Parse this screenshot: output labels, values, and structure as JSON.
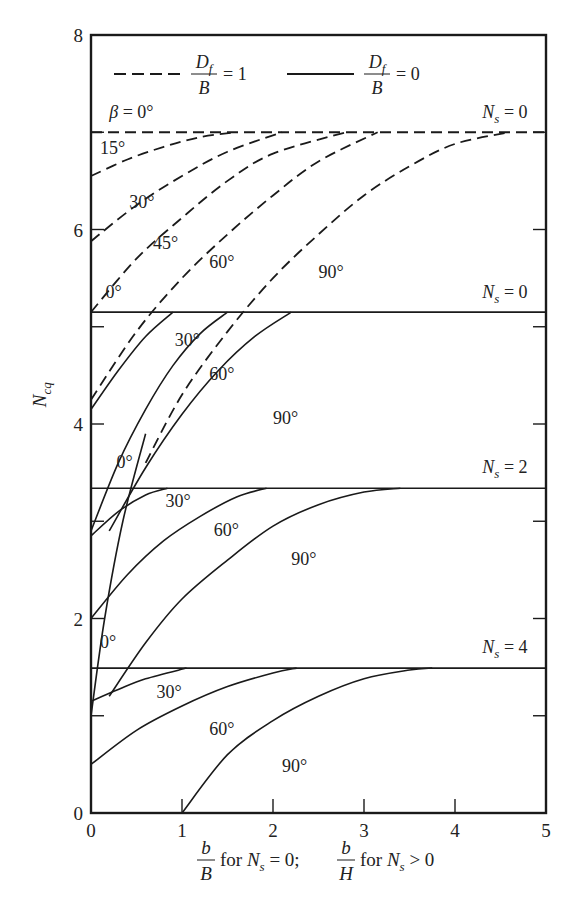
{
  "chart_data": {
    "type": "line",
    "title": "",
    "xlabel": "b/B for N_s = 0; b/H for N_s > 0",
    "ylabel": "N_cq",
    "xlim": [
      0,
      5
    ],
    "ylim": [
      0,
      8
    ],
    "x_ticks": [
      "0",
      "1",
      "2",
      "3",
      "4",
      "5"
    ],
    "y_ticks": [
      "0",
      "2",
      "4",
      "6",
      "8"
    ],
    "grid": false,
    "legend": {
      "position": "top-inside",
      "entries": [
        {
          "style": "dashed",
          "label": "D_f/B = 1",
          "numerator": "D",
          "subscript": "f",
          "denominator": "B",
          "value": "= 1"
        },
        {
          "style": "solid",
          "label": "D_f/B = 0",
          "numerator": "D",
          "subscript": "f",
          "denominator": "B",
          "value": "= 0"
        }
      ]
    },
    "annotations": [
      {
        "text": "β = 0°",
        "x": 0.2,
        "y": 7.15
      },
      {
        "text": "N_s = 0",
        "x": 4.3,
        "y": 7.15
      },
      {
        "text": "N_s = 0",
        "x": 4.3,
        "y": 5.3
      },
      {
        "text": "N_s = 2",
        "x": 4.3,
        "y": 3.5
      },
      {
        "text": "N_s = 4",
        "x": 4.3,
        "y": 1.65
      }
    ],
    "series": [
      {
        "name": "Df/B=1, Ns=0, β=0°",
        "style": "dashed",
        "label": "β = 0°",
        "x": [
          0,
          5
        ],
        "y": [
          7.0,
          7.0
        ]
      },
      {
        "name": "Df/B=1, Ns=0, β=15°",
        "style": "dashed",
        "label": "15°",
        "x": [
          0,
          0.4,
          0.8,
          1.2,
          1.6
        ],
        "y": [
          6.55,
          6.72,
          6.85,
          6.95,
          7.0
        ]
      },
      {
        "name": "Df/B=1, Ns=0, β=30°",
        "style": "dashed",
        "label": "30°",
        "x": [
          0,
          0.5,
          1.0,
          1.5,
          2.1
        ],
        "y": [
          5.88,
          6.25,
          6.55,
          6.8,
          7.0
        ]
      },
      {
        "name": "Df/B=1, Ns=0, β=45°",
        "style": "dashed",
        "label": "45°",
        "x": [
          0,
          0.5,
          1.0,
          1.5,
          2.0,
          2.8
        ],
        "y": [
          5.15,
          5.7,
          6.12,
          6.5,
          6.78,
          7.0
        ]
      },
      {
        "name": "Df/B=1, Ns=0, β=60°",
        "style": "dashed",
        "label": "60°",
        "x": [
          0.0,
          0.5,
          1.0,
          1.5,
          2.0,
          2.5,
          3.15
        ],
        "y": [
          4.25,
          4.95,
          5.5,
          5.95,
          6.35,
          6.7,
          7.0
        ]
      },
      {
        "name": "Df/B=1, Ns=0, β=90°",
        "style": "dashed",
        "label": "90°",
        "x": [
          0.6,
          1.0,
          1.5,
          2.0,
          2.5,
          3.0,
          3.5,
          4.0,
          4.6
        ],
        "y": [
          3.6,
          4.3,
          4.95,
          5.5,
          5.95,
          6.35,
          6.65,
          6.88,
          7.0
        ]
      },
      {
        "name": "Df/B=0, Ns=0, β=0°",
        "style": "solid",
        "label": "0°",
        "x": [
          0,
          5
        ],
        "y": [
          5.15,
          5.15
        ]
      },
      {
        "name": "Df/B=0, Ns=0, β=30°",
        "style": "solid",
        "label": "30°",
        "x": [
          0,
          0.3,
          0.6,
          0.9
        ],
        "y": [
          4.15,
          4.55,
          4.9,
          5.15
        ]
      },
      {
        "name": "Df/B=0, Ns=0, β=60°",
        "style": "solid",
        "label": "60°",
        "x": [
          0,
          0.3,
          0.6,
          0.9,
          1.2,
          1.5
        ],
        "y": [
          2.9,
          3.6,
          4.15,
          4.6,
          4.93,
          5.15
        ]
      },
      {
        "name": "Df/B=0, Ns=0, β=90°",
        "style": "solid",
        "label": "90°",
        "x": [
          0.2,
          0.6,
          1.0,
          1.4,
          1.8,
          2.2
        ],
        "y": [
          2.9,
          3.55,
          4.1,
          4.55,
          4.9,
          5.15
        ]
      },
      {
        "name": "Df/B=0, Ns=2, β=0°",
        "style": "solid",
        "label": "0°",
        "x": [
          0,
          5
        ],
        "y": [
          3.34,
          3.34
        ]
      },
      {
        "name": "Df/B=0, Ns=2, β=30°",
        "style": "solid",
        "label": "30°",
        "x": [
          0,
          0.3,
          0.6,
          0.84
        ],
        "y": [
          2.85,
          3.1,
          3.27,
          3.34
        ]
      },
      {
        "name": "Df/B=0, Ns=2, β=60°",
        "style": "solid",
        "label": "60°",
        "x": [
          0,
          0.4,
          0.8,
          1.2,
          1.6,
          1.93
        ],
        "y": [
          2.0,
          2.45,
          2.8,
          3.05,
          3.25,
          3.34
        ]
      },
      {
        "name": "Df/B=0, Ns=2, β=90°",
        "style": "solid",
        "label": "90°",
        "x": [
          0.2,
          0.6,
          1.0,
          1.5,
          2.0,
          2.5,
          3.0,
          3.4
        ],
        "y": [
          1.2,
          1.75,
          2.2,
          2.6,
          2.95,
          3.17,
          3.3,
          3.34
        ]
      },
      {
        "name": "Df/B=0, Ns=4, β=0°",
        "style": "solid",
        "label": "0°",
        "x": [
          0,
          5
        ],
        "y": [
          1.49,
          1.49
        ]
      },
      {
        "name": "Df/B=0, Ns=4, β=30°",
        "style": "solid",
        "label": "30°",
        "x": [
          0,
          0.3,
          0.6,
          1.05
        ],
        "y": [
          1.15,
          1.27,
          1.38,
          1.49
        ]
      },
      {
        "name": "Df/B=0, Ns=4, β=60°",
        "style": "solid",
        "label": "60°",
        "x": [
          0,
          0.5,
          1.0,
          1.5,
          2.0,
          2.26
        ],
        "y": [
          0.5,
          0.85,
          1.1,
          1.3,
          1.44,
          1.49
        ]
      },
      {
        "name": "Df/B=0, Ns=4, β=90°",
        "style": "solid",
        "label": "90°",
        "x": [
          1.0,
          1.5,
          2.0,
          2.5,
          3.0,
          3.5,
          3.75
        ],
        "y": [
          0.0,
          0.6,
          0.95,
          1.2,
          1.38,
          1.47,
          1.49
        ]
      },
      {
        "name": "Df/B=0, Ns=0 β=0° transition (0° label curve, Ns=2 region)",
        "style": "solid",
        "label": "0°",
        "x": [
          0,
          0.15,
          0.35,
          0.6
        ],
        "y": [
          1.0,
          2.0,
          3.0,
          3.9
        ]
      }
    ]
  }
}
